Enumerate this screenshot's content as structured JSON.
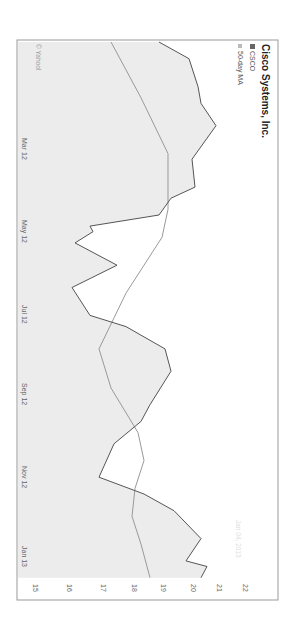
{
  "chart_data": {
    "type": "area",
    "title": "Cisco Systems, Inc.",
    "rotation_deg": 90,
    "xlabel": "",
    "ylabel": "",
    "ylim": [
      15,
      22
    ],
    "y_ticks": [
      15,
      16,
      17,
      18,
      19,
      20,
      21,
      22
    ],
    "x_tick_labels": [
      "Mar 12",
      "May 12",
      "Jul 12",
      "Sep 12",
      "Nov 12",
      "Jan 13"
    ],
    "legend": [
      "CSCO",
      "50-day MA"
    ],
    "legend_position": "top-left",
    "grid": false,
    "credit": "© Yahoo!",
    "date_stamp": "Jan 04, 2013",
    "series": [
      {
        "name": "CSCO",
        "style": "line-with-fill",
        "x": [
          0,
          0.03,
          0.08,
          0.11,
          0.15,
          0.21,
          0.26,
          0.28,
          0.31,
          0.33,
          0.34,
          0.36,
          0.4,
          0.44,
          0.49,
          0.51,
          0.55,
          0.59,
          0.65,
          0.68,
          0.72,
          0.78,
          0.81,
          0.84,
          0.89,
          0.93,
          0.94,
          0.96
        ],
        "values": [
          19.1,
          20.1,
          20.4,
          20.5,
          21.0,
          20.2,
          20.3,
          19.5,
          19.1,
          16.8,
          16.9,
          16.3,
          17.7,
          16.2,
          16.8,
          18.0,
          19.3,
          19.5,
          18.8,
          18.5,
          17.6,
          17.1,
          18.6,
          19.6,
          20.5,
          20.0,
          20.7,
          20.5
        ]
      },
      {
        "name": "50-day MA",
        "style": "line",
        "x": [
          0,
          0.1,
          0.2,
          0.3,
          0.35,
          0.45,
          0.55,
          0.62,
          0.7,
          0.75,
          0.8,
          0.85,
          0.9,
          0.96
        ],
        "values": [
          17.5,
          18.5,
          19.4,
          19.4,
          19.2,
          18.0,
          17.1,
          17.5,
          18.4,
          18.6,
          18.3,
          18.2,
          18.5,
          18.8
        ]
      }
    ]
  },
  "labels": {
    "title": "Cisco Systems, Inc.",
    "legend_csco": "CSCO",
    "legend_ma": "50-day MA",
    "credit": "© Yahoo!",
    "date_stamp": "Jan 04, 2013",
    "y_ticks": [
      "15",
      "16",
      "17",
      "18",
      "19",
      "20",
      "21",
      "22"
    ],
    "x_ticks": [
      "Mar 12",
      "May 12",
      "Jul 12",
      "Sep 12",
      "Nov 12",
      "Jan 13"
    ]
  },
  "colors": {
    "price_line": "#555555",
    "ma_line": "#999999",
    "fill": "#ececec",
    "frame": "#999999"
  }
}
